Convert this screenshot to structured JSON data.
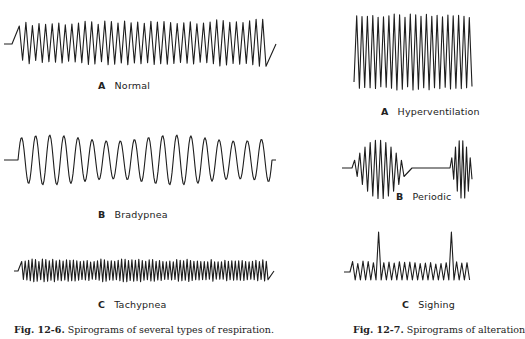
{
  "figures": [
    {
      "id": "fig-12-6",
      "caption_number": "Fig. 12-6.",
      "caption_text": " Spirograms of several types of respiration.",
      "panels": [
        {
          "letter": "A",
          "name": "Normal",
          "pattern": "normal",
          "cycles": 38
        },
        {
          "letter": "B",
          "name": "Bradypnea",
          "pattern": "bradypnea",
          "cycles": 18
        },
        {
          "letter": "C",
          "name": "Tachypnea",
          "pattern": "tachypnea",
          "cycles": 72
        }
      ]
    },
    {
      "id": "fig-12-7",
      "caption_number": "Fig. 12-7.",
      "caption_text": " Spirograms of alteration",
      "panels": [
        {
          "letter": "A",
          "name": "Hyperventilation",
          "pattern": "hyperventilation",
          "cycles": 22
        },
        {
          "letter": "B",
          "name": "Periodic",
          "pattern": "periodic"
        },
        {
          "letter": "C",
          "name": "Sighing",
          "pattern": "sighing"
        }
      ]
    }
  ],
  "colors": {
    "trace": "#1e1e1e",
    "text": "#222222",
    "background": "#ffffff"
  }
}
